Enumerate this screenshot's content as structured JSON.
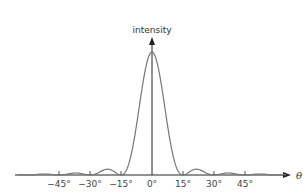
{
  "chart_data": {
    "type": "line",
    "title": "",
    "xlabel": "θ",
    "ylabel": "intensity",
    "x_unit": "degrees",
    "xlim": [
      -65,
      65
    ],
    "ylim": [
      0,
      1
    ],
    "grid": false,
    "legend": "none",
    "x_ticks": [
      -45,
      -30,
      -15,
      0,
      15,
      30,
      45
    ],
    "x_tick_labels": [
      "−45°",
      "−30°",
      "−15°",
      "0°",
      "15°",
      "30°",
      "45°"
    ],
    "series": [
      {
        "name": "intensity",
        "function": "single-slit diffraction (sinc^2)",
        "first_minimum_deg": 15,
        "x": [
          -60,
          -52.5,
          -45,
          -37.5,
          -30,
          -22.5,
          -15,
          -10,
          -7.5,
          -5,
          -2.5,
          0,
          2.5,
          5,
          7.5,
          10,
          15,
          22.5,
          30,
          37.5,
          45,
          52.5,
          60
        ],
        "values": [
          0,
          0.016,
          0,
          0.016,
          0,
          0.045,
          0,
          0.17,
          0.41,
          0.68,
          0.91,
          1.0,
          0.91,
          0.68,
          0.41,
          0.17,
          0,
          0.045,
          0,
          0.016,
          0,
          0.016,
          0
        ]
      }
    ]
  },
  "colors": {
    "curve": "#777777",
    "axis": "#222222"
  }
}
